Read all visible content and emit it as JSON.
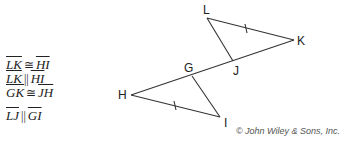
{
  "givens": [
    {
      "left": "LK",
      "relation": "≅",
      "right": "HI"
    },
    {
      "left": "LK",
      "relation": "||",
      "right": "HI"
    },
    {
      "left": "GK",
      "relation": "≅",
      "right": "JH"
    },
    {
      "left": "LJ",
      "relation": "||",
      "right": "GI"
    }
  ],
  "diagram": {
    "stroke_color": "#333333",
    "vertices": {
      "L": {
        "label": "L",
        "x": 207,
        "y": 18
      },
      "K": {
        "label": "K",
        "x": 294,
        "y": 40
      },
      "J": {
        "label": "J",
        "x": 233,
        "y": 61
      },
      "G": {
        "label": "G",
        "x": 192,
        "y": 76
      },
      "H": {
        "label": "H",
        "x": 131,
        "y": 95
      },
      "I": {
        "label": "I",
        "x": 220,
        "y": 117
      }
    },
    "segments": [
      "LK",
      "LJ",
      "KH",
      "HI",
      "GI"
    ],
    "congruence_ticks": [
      "LK",
      "HI"
    ]
  },
  "credit": "© John Wiley & Sons, Inc."
}
